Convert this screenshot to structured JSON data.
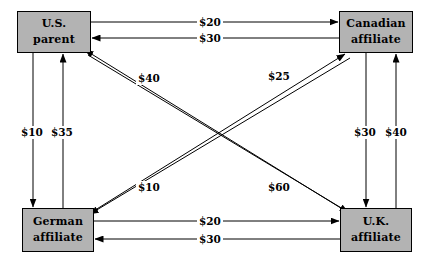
{
  "diagram": {
    "type": "flow-diagram",
    "title": "",
    "nodes": [
      {
        "id": "us-parent",
        "line1": "U.S.",
        "line2": "parent",
        "x": 17,
        "y": 11,
        "w": 74,
        "h": 42
      },
      {
        "id": "canadian-affiliate",
        "line1": "Canadian",
        "line2": "affiliate",
        "x": 339,
        "y": 11,
        "w": 74,
        "h": 42
      },
      {
        "id": "german-affiliate",
        "line1": "German",
        "line2": "affiliate",
        "x": 22,
        "y": 208,
        "w": 72,
        "h": 44
      },
      {
        "id": "uk-affiliate",
        "line1": "U.K.",
        "line2": "affiliate",
        "x": 340,
        "y": 208,
        "w": 72,
        "h": 44
      }
    ],
    "flows": [
      {
        "id": "us-to-canadian",
        "from": "us-parent",
        "to": "canadian-affiliate",
        "amount": "$20",
        "label_x": 197,
        "label_y": 16
      },
      {
        "id": "canadian-to-us",
        "from": "canadian-affiliate",
        "to": "us-parent",
        "amount": "$30",
        "label_x": 197,
        "label_y": 32
      },
      {
        "id": "german-to-uk",
        "from": "german-affiliate",
        "to": "uk-affiliate",
        "amount": "$20",
        "label_x": 197,
        "label_y": 215
      },
      {
        "id": "uk-to-german",
        "from": "uk-affiliate",
        "to": "german-affiliate",
        "amount": "$30",
        "label_x": 197,
        "label_y": 233
      },
      {
        "id": "us-to-german",
        "from": "us-parent",
        "to": "german-affiliate",
        "amount": "$10",
        "label_x": 19,
        "label_y": 126
      },
      {
        "id": "german-to-us",
        "from": "german-affiliate",
        "to": "us-parent",
        "amount": "$35",
        "label_x": 49,
        "label_y": 126
      },
      {
        "id": "canadian-to-uk",
        "from": "canadian-affiliate",
        "to": "uk-affiliate",
        "amount": "$30",
        "label_x": 352,
        "label_y": 126
      },
      {
        "id": "uk-to-canadian",
        "from": "uk-affiliate",
        "to": "canadian-affiliate",
        "amount": "$40",
        "label_x": 383,
        "label_y": 126
      },
      {
        "id": "uk-to-us",
        "from": "uk-affiliate",
        "to": "us-parent",
        "amount": "$40",
        "label_x": 136,
        "label_y": 72
      },
      {
        "id": "german-to-canadian",
        "from": "german-affiliate",
        "to": "canadian-affiliate",
        "amount": "$25",
        "label_x": 266,
        "label_y": 70
      },
      {
        "id": "canadian-to-german",
        "from": "canadian-affiliate",
        "to": "german-affiliate",
        "amount": "$10",
        "label_x": 136,
        "label_y": 181
      },
      {
        "id": "us-to-uk",
        "from": "us-parent",
        "to": "uk-affiliate",
        "amount": "$60",
        "label_x": 266,
        "label_y": 181
      }
    ],
    "colors": {
      "node_fill": "#b3b3b3",
      "node_border": "#000000",
      "line": "#000000",
      "background": "#ffffff"
    }
  }
}
